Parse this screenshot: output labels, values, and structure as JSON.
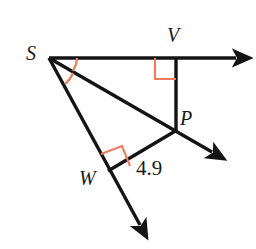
{
  "figure": {
    "name": "right-triangle-angle-bisector-diagram",
    "background_color": "#ffffff",
    "stroke_color": "#141414",
    "mark_color": "#ef7a5e",
    "width": 256,
    "height": 249
  },
  "labels": {
    "s": "S",
    "v": "V",
    "p": "P",
    "w": "W",
    "measure": "4.9"
  },
  "points": {
    "S": {
      "x": 49,
      "y": 58
    },
    "V": {
      "x": 176,
      "y": 58
    },
    "P": {
      "x": 176,
      "y": 130
    },
    "W": {
      "x": 109,
      "y": 170
    }
  },
  "rays": [
    {
      "name": "ray-SV-horizontal",
      "from": {
        "x": 49,
        "y": 58
      },
      "to": {
        "x": 243,
        "y": 58
      },
      "arrow": true
    },
    {
      "name": "ray-SP-diagonal",
      "from": {
        "x": 49,
        "y": 58
      },
      "to": {
        "x": 219,
        "y": 157
      },
      "arrow": true
    },
    {
      "name": "ray-SW-lower",
      "from": {
        "x": 49,
        "y": 58
      },
      "to": {
        "x": 146,
        "y": 234
      },
      "arrow": true
    }
  ],
  "segments": [
    {
      "name": "segment-VP",
      "from": {
        "x": 176,
        "y": 58
      },
      "to": {
        "x": 176,
        "y": 130
      }
    },
    {
      "name": "segment-PW",
      "from": {
        "x": 176,
        "y": 130
      },
      "to": {
        "x": 109,
        "y": 170
      }
    }
  ],
  "right_angle_marks": [
    {
      "name": "right-angle-mark-at-V",
      "vertex": {
        "x": 176,
        "y": 58
      },
      "size": 21
    },
    {
      "name": "right-angle-mark-at-W",
      "vertex": {
        "x": 109,
        "y": 170
      },
      "size": 21
    }
  ],
  "angle_arcs": [
    {
      "name": "angle-arc-upper-at-S"
    },
    {
      "name": "angle-arc-lower-at-S"
    }
  ]
}
